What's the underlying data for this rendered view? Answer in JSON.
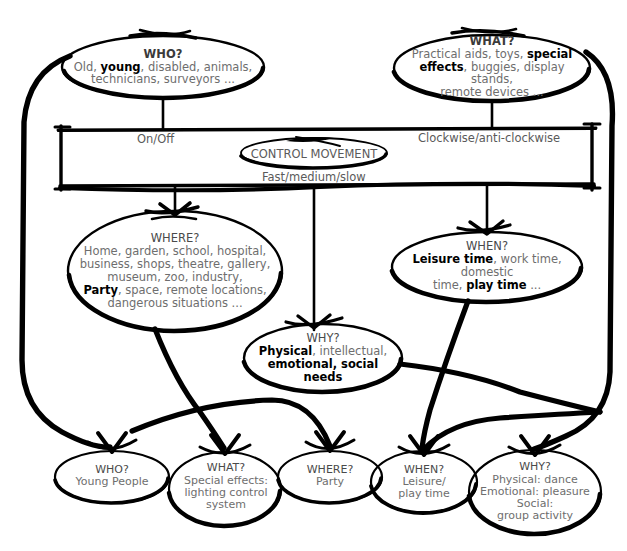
{
  "diagram": {
    "ink_color": "#000000",
    "text_color": "#6e6e6e",
    "background": "#ffffff"
  },
  "top_nodes": {
    "who": {
      "heading": "WHO?",
      "line1_a": "Old, ",
      "line1_b": "young",
      "line1_c": ", disabled, animals,",
      "line2": "technicians, surveyors ..."
    },
    "what": {
      "heading": "WHAT?",
      "line1_a": "Practical aids, toys, ",
      "line1_b": "special",
      "line2_b": "effects",
      "line2_c": ", buggies, display stands,",
      "line3": "remote devices ..."
    }
  },
  "control_box": {
    "center_label": "CONTROL MOVEMENT",
    "label_left": "On/Off",
    "label_right": "Clockwise/anti-clockwise",
    "label_bottom": "Fast/medium/slow"
  },
  "mid_nodes": {
    "where": {
      "heading": "WHERE?",
      "line1": "Home, garden, school, hospital,",
      "line2": "business, shops, theatre, gallery,",
      "line3": "museum, zoo, industry,",
      "line4_b": "Party",
      "line4_c": ", space, remote locations,",
      "line5": "dangerous situations ..."
    },
    "when": {
      "heading": "WHEN?",
      "line1_b": "Leisure time",
      "line1_c": ", work time, domestic",
      "line2_a": "time, ",
      "line2_b": "play time",
      "line2_c": " ..."
    },
    "why": {
      "heading": "WHY?",
      "line1_b": "Physical",
      "line1_c": ", intellectual,",
      "line2_b": "emotional, social needs"
    }
  },
  "outcome_nodes": [
    {
      "id": "who",
      "heading": "WHO?",
      "lines": [
        "Young People"
      ]
    },
    {
      "id": "what",
      "heading": "WHAT?",
      "lines": [
        "Special effects:",
        "lighting control",
        "system"
      ]
    },
    {
      "id": "where",
      "heading": "WHERE?",
      "lines": [
        "Party"
      ]
    },
    {
      "id": "when",
      "heading": "WHEN?",
      "lines": [
        "Leisure/",
        "play time"
      ]
    },
    {
      "id": "why",
      "heading": "WHY?",
      "lines": [
        "Physical: dance",
        "Emotional: pleasure",
        "Social:",
        "group activity"
      ]
    }
  ]
}
